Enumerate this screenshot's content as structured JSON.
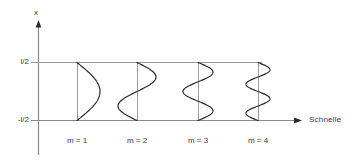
{
  "figure": {
    "background_color": "#ffffff",
    "axis_color": "#808080",
    "curve_color": "#2b2b2b",
    "baseline_color": "#9a9a9a",
    "text_color": "#3a3a3a"
  },
  "axes": {
    "y_axis_label": "x",
    "x_axis_label": "Schnelle",
    "y_tick_top": "l/2",
    "y_tick_bottom": "-l/2"
  },
  "chart_data": {
    "type": "line",
    "title": "",
    "subtitle": "",
    "xlabel": "Schnelle",
    "ylabel": "x",
    "grid": false,
    "legend_position": "none",
    "y_tick_labels": [
      "l/2",
      "-l/2"
    ],
    "y_tick_values": [
      0.5,
      -0.5
    ],
    "ylim": [
      -0.5,
      0.5
    ],
    "annotations": [
      "m = 1",
      "m = 2",
      "m = 3",
      "m = 4"
    ],
    "series": [
      {
        "name": "m = 1",
        "label": "m = 1",
        "mode_number": 1,
        "half_periods": 1,
        "baseline_x": 77,
        "amplitude_px": 23,
        "direction": "right"
      },
      {
        "name": "m = 2",
        "label": "m = 2",
        "mode_number": 2,
        "half_periods": 2,
        "baseline_x": 137,
        "amplitude_px": 19,
        "direction": "right"
      },
      {
        "name": "m = 3",
        "label": "m = 3",
        "mode_number": 3,
        "half_periods": 3,
        "baseline_x": 198,
        "amplitude_px": 15,
        "direction": "right"
      },
      {
        "name": "m = 4",
        "label": "m = 4",
        "mode_number": 4,
        "half_periods": 4,
        "baseline_x": 258,
        "amplitude_px": 12,
        "direction": "right"
      }
    ]
  }
}
